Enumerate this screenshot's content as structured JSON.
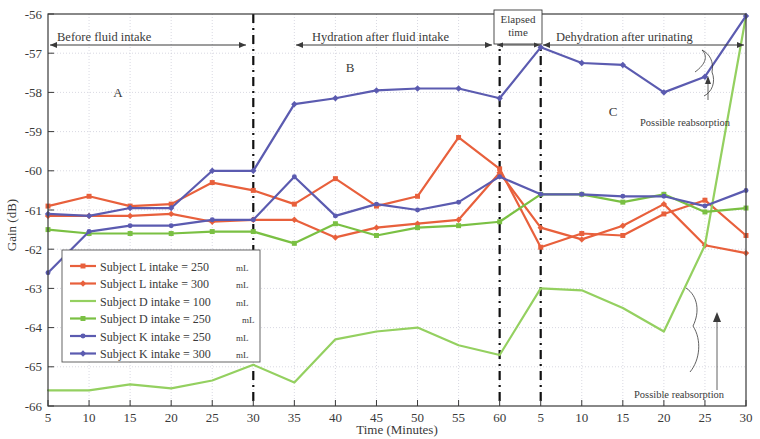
{
  "axes": {
    "ylabel": "Gain (dB)",
    "xlabel": "Time (Minutes)",
    "yticks": [
      "-56",
      "-57",
      "-58",
      "-59",
      "-60",
      "-61",
      "-62",
      "-63",
      "-64",
      "-65",
      "-66"
    ],
    "ylim": [
      -66,
      -56
    ],
    "xticks": [
      "5",
      "10",
      "15",
      "20",
      "25",
      "30",
      "35",
      "40",
      "45",
      "50",
      "55",
      "60",
      "5",
      "10",
      "15",
      "20",
      "25",
      "30"
    ]
  },
  "phases": [
    {
      "name": "before-fluid-intake",
      "label": "Before fluid intake"
    },
    {
      "name": "hydration-after-fluid-intake",
      "label": "Hydration after fluid intake"
    },
    {
      "name": "elapsed-time",
      "label_line1": "Elapsed",
      "label_line2": "time"
    },
    {
      "name": "dehydration-after-urinating",
      "label": "Dehydration after urinating"
    }
  ],
  "zones": [
    {
      "name": "zone-a",
      "label": "A"
    },
    {
      "name": "zone-b",
      "label": "B"
    },
    {
      "name": "zone-c",
      "label": "C"
    }
  ],
  "annotations": [
    {
      "name": "annotation-upper",
      "label": "Possible reabsorption"
    },
    {
      "name": "annotation-lower",
      "label": "Possible reabsorption"
    }
  ],
  "legend": {
    "items": [
      {
        "label": "Subject L intake = 250",
        "unit": "mL",
        "color": "#e8603c",
        "marker": "square"
      },
      {
        "label": "Subject L intake = 300",
        "unit": "mL",
        "color": "#e8603c",
        "marker": "diamond"
      },
      {
        "label": "Subject D intake = 100",
        "unit": "mL",
        "color": "#94d060",
        "marker": "none"
      },
      {
        "label": "Subject D intake =  250",
        "unit": "mL",
        "color": "#7ac043",
        "marker": "square"
      },
      {
        "label": "Subject K intake = 250",
        "unit": "mL",
        "color": "#5b5bb0",
        "marker": "circle"
      },
      {
        "label": "Subject K intake = 300",
        "unit": "mL",
        "color": "#5b5bb0",
        "marker": "diamond"
      }
    ]
  },
  "chart_data": {
    "type": "line",
    "title": "",
    "xlabel": "Time (Minutes)",
    "ylabel": "Gain (dB)",
    "ylim": [
      -66,
      -56
    ],
    "grid": true,
    "legend_position": "lower-left",
    "x": [
      5,
      10,
      15,
      20,
      25,
      30,
      35,
      40,
      45,
      50,
      55,
      60,
      65,
      70,
      75,
      80,
      85,
      90
    ],
    "xtick_labels": [
      "5",
      "10",
      "15",
      "20",
      "25",
      "30",
      "35",
      "40",
      "45",
      "50",
      "55",
      "60",
      "5",
      "10",
      "15",
      "20",
      "25",
      "30"
    ],
    "phase_boundaries": [
      30,
      60,
      65
    ],
    "series": [
      {
        "name": "Subject L intake = 250 mL",
        "color": "#e8603c",
        "marker": "square",
        "values": [
          -60.9,
          -60.65,
          -60.9,
          -60.85,
          -60.3,
          -60.5,
          -60.85,
          -60.2,
          -60.9,
          -60.65,
          -59.15,
          -59.95,
          -61.95,
          -61.6,
          -61.65,
          -61.1,
          -60.75,
          -61.65
        ]
      },
      {
        "name": "Subject L intake = 300 mL",
        "color": "#e8603c",
        "marker": "diamond",
        "values": [
          -61.15,
          -61.15,
          -61.15,
          -61.1,
          -61.3,
          -61.25,
          -61.25,
          -61.7,
          -61.45,
          -61.35,
          -61.25,
          -60.05,
          -61.45,
          -61.75,
          -61.4,
          -60.85,
          -61.9,
          -62.1
        ]
      },
      {
        "name": "Subject D intake = 100 mL",
        "color": "#94d060",
        "marker": "none",
        "values": [
          -65.6,
          -65.6,
          -65.45,
          -65.55,
          -65.35,
          -64.95,
          -65.4,
          -64.3,
          -64.1,
          -64.0,
          -64.45,
          -64.7,
          -63.0,
          -63.05,
          -63.5,
          -64.1,
          -61.9,
          -56.05
        ]
      },
      {
        "name": "Subject D intake =  250 mL",
        "color": "#7ac043",
        "marker": "square",
        "values": [
          -61.5,
          -61.6,
          -61.6,
          -61.6,
          -61.55,
          -61.55,
          -61.85,
          -61.35,
          -61.65,
          -61.45,
          -61.4,
          -61.3,
          -60.6,
          -60.6,
          -60.8,
          -60.6,
          -61.05,
          -60.95
        ]
      },
      {
        "name": "Subject K intake = 250 mL",
        "color": "#5b5bb0",
        "marker": "circle",
        "values": [
          -62.6,
          -61.55,
          -61.4,
          -61.4,
          -61.25,
          -61.25,
          -60.15,
          -61.15,
          -60.85,
          -61.0,
          -60.8,
          -60.15,
          -60.6,
          -60.6,
          -60.65,
          -60.65,
          -60.9,
          -60.5
        ]
      },
      {
        "name": "Subject K intake = 300 mL",
        "color": "#5b5bb0",
        "marker": "diamond",
        "values": [
          -61.1,
          -61.15,
          -60.95,
          -60.95,
          -60.0,
          -60.0,
          -58.3,
          -58.15,
          -57.95,
          -57.9,
          -57.9,
          -58.15,
          -56.85,
          -57.25,
          -57.3,
          -58.0,
          -57.6,
          -56.05
        ]
      }
    ]
  }
}
